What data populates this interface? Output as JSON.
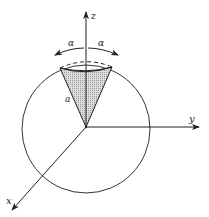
{
  "diagram": {
    "type": "3d-coordinate-sphere-cone",
    "axes": {
      "z_label": "z",
      "y_label": "y",
      "x_label": "x"
    },
    "angle_labels": {
      "left": "α",
      "right": "α"
    },
    "cone_side_label": "a",
    "colors": {
      "line": "#222222",
      "cone_fill": "#cfcfcf",
      "background": "#ffffff"
    }
  }
}
